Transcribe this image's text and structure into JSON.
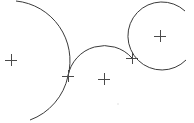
{
  "canvas": {
    "width": 194,
    "height": 123,
    "background": "#ffffff",
    "stroke_color": "#3a3a3a"
  },
  "arcs": [
    {
      "name": "left-large-arc",
      "center": [
        11,
        60
      ],
      "radius": 62,
      "path": "M 16 1 A 60 60 0 0 1 68 76 A 60 60 0 0 1 30 120"
    },
    {
      "name": "middle-arc",
      "center": [
        104,
        79
      ],
      "radius": 37,
      "path": "M 68 76 A 37 37 0 0 1 132 58"
    },
    {
      "name": "right-circle-arc",
      "center": [
        160,
        36
      ],
      "radius": 34,
      "path": "M 185 11 A 34 34 0 1 0 186 60"
    }
  ],
  "markers": [
    {
      "name": "center-marker-left",
      "x": 11,
      "y": 60
    },
    {
      "name": "intersection-marker-left",
      "x": 68,
      "y": 76
    },
    {
      "name": "center-marker-middle",
      "x": 104,
      "y": 79
    },
    {
      "name": "intersection-marker-right",
      "x": 132,
      "y": 58
    },
    {
      "name": "center-marker-right",
      "x": 160,
      "y": 36
    }
  ],
  "marker_size": 6,
  "faint_dot": {
    "x": 118,
    "y": 104
  }
}
